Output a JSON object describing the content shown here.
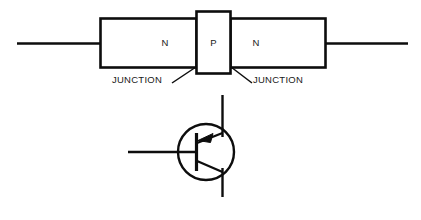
{
  "figure": {
    "stroke_color": "#0d0d0d",
    "background_color": "#ffffff",
    "text_color": "#1a1a1a"
  },
  "structure": {
    "regions": [
      {
        "label": "N",
        "type": "n-region",
        "position": "left"
      },
      {
        "label": "P",
        "type": "p-region",
        "position": "center"
      },
      {
        "label": "N",
        "type": "n-region",
        "position": "right"
      }
    ],
    "callouts": [
      {
        "label": "JUNCTION",
        "side": "left"
      },
      {
        "label": "JUNCTION",
        "side": "right"
      }
    ]
  },
  "symbol": {
    "name": "bipolar-transistor-symbol",
    "arrow_direction": "inward",
    "terminals": [
      "base",
      "collector",
      "emitter"
    ]
  }
}
